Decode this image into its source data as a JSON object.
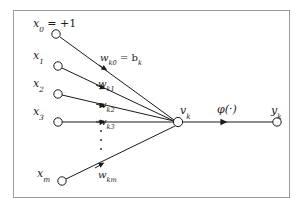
{
  "diagram": {
    "background_color": "#ffffff",
    "frame_color": "#9a9a9a",
    "stroke_color": "#1a1a1a",
    "inputs": [
      {
        "id": "x0",
        "label": "x",
        "subscript": "0",
        "suffix": " = +1",
        "node_x": 56,
        "node_y": 34,
        "label_x": 33,
        "label_y": 18
      },
      {
        "id": "x1",
        "label": "x",
        "subscript": "1",
        "suffix": "",
        "node_x": 58,
        "node_y": 66,
        "label_x": 33,
        "label_y": 50
      },
      {
        "id": "x2",
        "label": "x",
        "subscript": "2",
        "suffix": "",
        "node_x": 58,
        "node_y": 94,
        "label_x": 33,
        "label_y": 78
      },
      {
        "id": "x3",
        "label": "x",
        "subscript": "3",
        "suffix": "",
        "node_x": 58,
        "node_y": 122,
        "label_x": 33,
        "label_y": 106
      },
      {
        "id": "xm",
        "label": "x",
        "subscript": "m",
        "suffix": "",
        "node_x": 62,
        "node_y": 181,
        "label_x": 37,
        "label_y": 168
      }
    ],
    "weights": [
      {
        "id": "wk0",
        "label": "w",
        "subscript": "k0",
        "suffix": " = b",
        "suffix_sub": "k",
        "label_x": 100,
        "label_y": 53,
        "marker_x": 104,
        "marker_y": 61
      },
      {
        "id": "wk1",
        "label": "w",
        "subscript": "k1",
        "suffix": "",
        "suffix_sub": "",
        "label_x": 98,
        "label_y": 79,
        "marker_x": 102,
        "marker_y": 87
      },
      {
        "id": "wk2",
        "label": "w",
        "subscript": "k2",
        "suffix": "",
        "suffix_sub": "",
        "label_x": 98,
        "label_y": 100,
        "marker_x": 102,
        "marker_y": 108
      },
      {
        "id": "wk3",
        "label": "w",
        "subscript": "k3",
        "suffix": "",
        "suffix_sub": "",
        "label_x": 98,
        "label_y": 117,
        "marker_x": 102,
        "marker_y": 124
      },
      {
        "id": "wkm",
        "label": "w",
        "subscript": "km",
        "suffix": "",
        "suffix_sub": "",
        "label_x": 98,
        "label_y": 170,
        "marker_x": 101,
        "marker_y": 165
      }
    ],
    "vertical_ellipsis": {
      "x": 101,
      "y_top": 129,
      "y_bottom": 151,
      "dots": 3
    },
    "summing_junction": {
      "id": "vk",
      "node_x": 178,
      "node_y": 122,
      "label": "v",
      "subscript": "k",
      "label_x": 180,
      "label_y": 105
    },
    "activation": {
      "id": "phi",
      "label": "φ(·)",
      "label_x": 217,
      "label_y": 104,
      "arrow_x": 221,
      "arrow_y": 122
    },
    "output": {
      "id": "yk",
      "node_x": 277,
      "node_y": 122,
      "label": "y",
      "subscript": "k",
      "label_x": 271,
      "label_y": 105
    }
  }
}
